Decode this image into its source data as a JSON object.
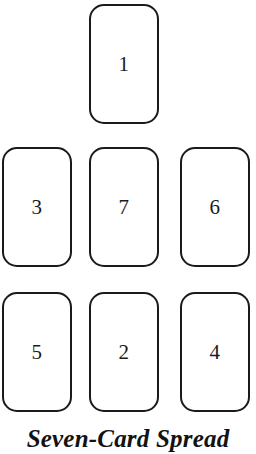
{
  "figure": {
    "caption": "Seven-Card Spread",
    "stroke_color": "#1a1a1a",
    "fill_color": "#ffffff",
    "background_color": "#ffffff",
    "text_color": "#1b1b1b"
  },
  "cards": [
    {
      "number": "1",
      "position_label": "top-center",
      "row": 1,
      "column": 2,
      "x": 89,
      "y": 4,
      "width": 70,
      "height": 120
    },
    {
      "number": "3",
      "position_label": "middle-left",
      "row": 2,
      "column": 1,
      "x": 2,
      "y": 147,
      "width": 70,
      "height": 120
    },
    {
      "number": "7",
      "position_label": "middle-center",
      "row": 2,
      "column": 2,
      "x": 89,
      "y": 147,
      "width": 70,
      "height": 120
    },
    {
      "number": "6",
      "position_label": "middle-right",
      "row": 2,
      "column": 3,
      "x": 180,
      "y": 147,
      "width": 70,
      "height": 120
    },
    {
      "number": "5",
      "position_label": "bottom-left",
      "row": 3,
      "column": 1,
      "x": 2,
      "y": 292,
      "width": 70,
      "height": 120
    },
    {
      "number": "2",
      "position_label": "bottom-center",
      "row": 3,
      "column": 2,
      "x": 89,
      "y": 292,
      "width": 70,
      "height": 120
    },
    {
      "number": "4",
      "position_label": "bottom-right",
      "row": 3,
      "column": 3,
      "x": 180,
      "y": 292,
      "width": 70,
      "height": 120
    }
  ]
}
